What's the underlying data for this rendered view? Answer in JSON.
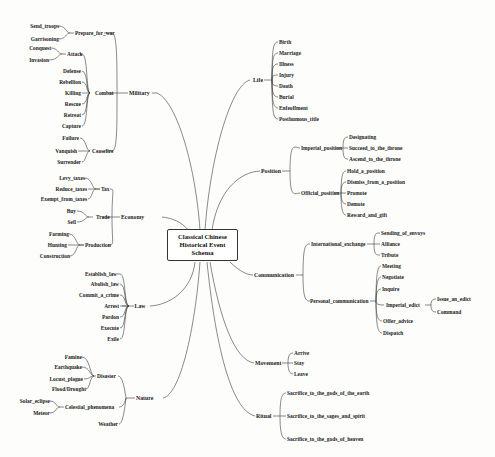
{
  "diagram": {
    "type": "mind_map",
    "root": {
      "lines": [
        "Classical Chinese",
        "Historical Event",
        "Schema"
      ]
    },
    "branches": {
      "military": {
        "label": "Military",
        "children": {
          "prepare_for_war": {
            "label": "Prepare_for_war",
            "children": [
              "Send_troops",
              "Garrisoning"
            ]
          },
          "combat": {
            "label": "Combat",
            "children": [
              "Defense",
              "Rebellion",
              "Killing",
              "Rescue",
              "Retreat",
              "Capture"
            ]
          },
          "attack": {
            "label": "Attack",
            "children": [
              "Conquest",
              "Invasion"
            ]
          },
          "ceasefire": {
            "label": "Ceasefire",
            "children": [
              "Failure",
              "Vanquish",
              "Surrender"
            ]
          }
        }
      },
      "economy": {
        "label": "Economy",
        "children": {
          "tax": {
            "label": "Tax",
            "children": [
              "Levy_taxes",
              "Reduce_taxes",
              "Exempt_from_taxes"
            ]
          },
          "trade": {
            "label": "Trade",
            "children": [
              "Buy",
              "Sell"
            ]
          },
          "production": {
            "label": "Production",
            "children": [
              "Farming",
              "Hunting",
              "Construction"
            ]
          }
        }
      },
      "law": {
        "label": "Law",
        "children": [
          "Establish_law",
          "Abolish_law",
          "Commit_a_crime",
          "Arrest",
          "Pardon",
          "Execute",
          "Exile"
        ]
      },
      "nature": {
        "label": "Nature",
        "children": {
          "disaster": {
            "label": "Disaster",
            "children": [
              "Famine",
              "Earthquake",
              "Locust_plague",
              "Flood/Drought"
            ]
          },
          "celestial": {
            "label": "Celestial_phenomena",
            "children": [
              "Solar_eclipse",
              "Meteor"
            ]
          },
          "weather": {
            "label": "Weather"
          }
        }
      },
      "life": {
        "label": "Life",
        "children": [
          "Birth",
          "Marriage",
          "Illness",
          "Injury",
          "Death",
          "Burial",
          "Enfeoffment",
          "Posthumous_title"
        ]
      },
      "position": {
        "label": "Position",
        "children": {
          "imperial": {
            "label": "Imperial_position",
            "children": [
              "Designating",
              "Succeed_to_the_throne",
              "Ascend_to_the_throne"
            ]
          },
          "official": {
            "label": "Official_position",
            "children": [
              "Hold_a_position",
              "Dismiss_from_a_position",
              "Promote",
              "Demote",
              "Reward_and_gift"
            ]
          }
        }
      },
      "communication": {
        "label": "Communication",
        "children": {
          "international": {
            "label": "International_exchange",
            "children": [
              "Sending_of_envoys",
              "Alliance",
              "Tribute"
            ]
          },
          "personal": {
            "label": "Personal_communication",
            "children": [
              "Meeting",
              "Negotiate",
              "Inquire",
              "Offer_advice",
              "Dispatch"
            ],
            "imperial_edict": {
              "label": "Imperial_edict",
              "children": [
                "Issue_an_edict",
                "Command"
              ]
            }
          }
        }
      },
      "movement": {
        "label": "Movement",
        "children": [
          "Arrive",
          "Stay",
          "Leave"
        ]
      },
      "ritual": {
        "label": "Ritual",
        "children": [
          "Sacrifice_to_the_gods_of_the_earth",
          "Sacrifice_to_the_sages_and_spirit",
          "Sacrifice_to_the_gods_of_heaven"
        ]
      }
    },
    "colors": {
      "line": "#3a3a3a",
      "text": "#1a1a1a",
      "background": "#fdfdfc",
      "box_border": "#333333"
    }
  }
}
